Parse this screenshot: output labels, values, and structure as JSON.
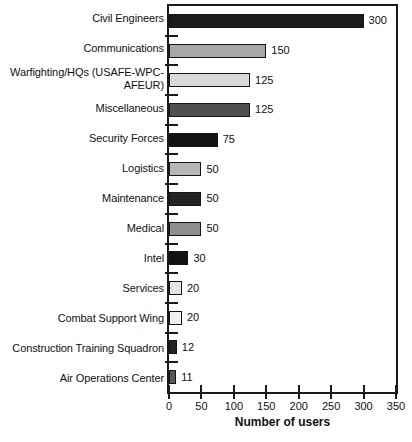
{
  "chart_data": {
    "type": "bar",
    "orientation": "horizontal",
    "title": "",
    "xlabel": "Number of users",
    "ylabel": "",
    "xlim": [
      0,
      350
    ],
    "xticks": [
      0,
      50,
      100,
      150,
      200,
      250,
      300,
      350
    ],
    "grid": false,
    "frame": true,
    "legend": "none",
    "bar_border_color": "#141414",
    "categories": [
      "Civil Engineers",
      "Communications",
      "Warfighting/HQs (USAFE-WPC-AFEUR)",
      "Miscellaneous",
      "Security Forces",
      "Logistics",
      "Maintenance",
      "Medical",
      "Intel",
      "Services",
      "Combat Support Wing",
      "Construction Training Squadron",
      "Air Operations Center"
    ],
    "values": [
      300,
      150,
      125,
      125,
      75,
      50,
      50,
      50,
      30,
      20,
      20,
      12,
      11
    ],
    "value_labels": [
      "300",
      "150",
      "125",
      "125",
      "75",
      "50",
      "50",
      "50",
      "30",
      "20",
      "20",
      "12",
      "11"
    ],
    "bar_colors": [
      "#1b1b1b",
      "#a7a7a7",
      "#d9d9d9",
      "#4f4f4f",
      "#121212",
      "#b6b6b6",
      "#232323",
      "#8f8f8f",
      "#121212",
      "#e3e3e3",
      "#f1f1f1",
      "#232323",
      "#575757"
    ]
  }
}
